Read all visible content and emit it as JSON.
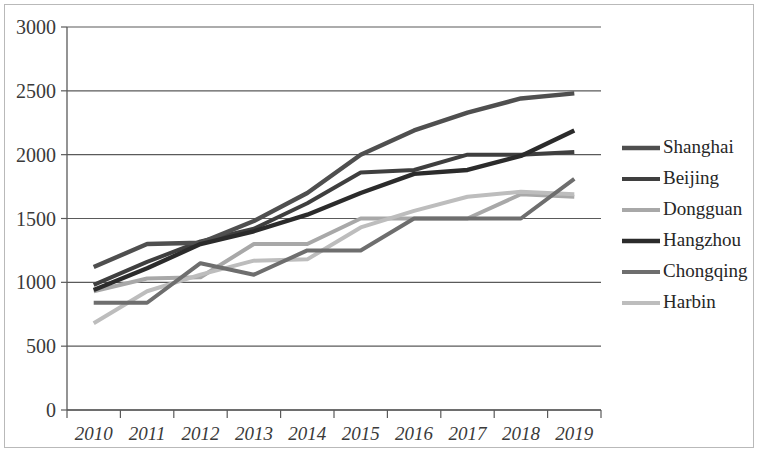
{
  "chart_data": {
    "type": "line",
    "title": "",
    "subtitle": "",
    "xlabel": "",
    "ylabel": "",
    "x": [
      "2010",
      "2011",
      "2012",
      "2013",
      "2014",
      "2015",
      "2016",
      "2017",
      "2018",
      "2019"
    ],
    "categories": [
      "2010",
      "2011",
      "2012",
      "2013",
      "2014",
      "2015",
      "2016",
      "2017",
      "2018",
      "2019"
    ],
    "xtick_labels": [
      "2010",
      "2011",
      "2012",
      "2013",
      "2014",
      "2015",
      "2016",
      "2017",
      "2018",
      "2019"
    ],
    "ytick_labels": [
      "0",
      "500",
      "1000",
      "1500",
      "2000",
      "2500",
      "3000"
    ],
    "ytick_values": [
      0,
      500,
      1000,
      1500,
      2000,
      2500,
      3000
    ],
    "ylim": [
      0,
      3000
    ],
    "grid": "horizontal",
    "legend_position": "right",
    "series": [
      {
        "name": "Shanghai",
        "color": "#4f4f4f",
        "width": 4.4,
        "values": [
          1120,
          1300,
          1310,
          1480,
          1700,
          2000,
          2190,
          2330,
          2440,
          2480
        ]
      },
      {
        "name": "Beijing",
        "color": "#3f3f3f",
        "width": 4.0,
        "values": [
          980,
          1160,
          1320,
          1420,
          1620,
          1860,
          1880,
          2000,
          2000,
          2020
        ]
      },
      {
        "name": "Dongguan",
        "color": "#a8a8a8",
        "width": 4.0,
        "values": [
          930,
          1030,
          1040,
          1300,
          1300,
          1500,
          1500,
          1500,
          1690,
          1670
        ]
      },
      {
        "name": "Hangzhou",
        "color": "#2b2b2b",
        "width": 4.4,
        "values": [
          940,
          1110,
          1300,
          1400,
          1530,
          1700,
          1850,
          1880,
          1990,
          2190
        ]
      },
      {
        "name": "Chongqing",
        "color": "#6e6e6e",
        "width": 4.0,
        "values": [
          840,
          840,
          1150,
          1060,
          1250,
          1250,
          1500,
          1500,
          1500,
          1810
        ]
      },
      {
        "name": "Harbin",
        "color": "#bdbdbd",
        "width": 4.0,
        "values": [
          680,
          930,
          1060,
          1170,
          1180,
          1430,
          1560,
          1670,
          1710,
          1690
        ]
      }
    ]
  },
  "legend": {
    "items": [
      {
        "label": "Shanghai"
      },
      {
        "label": "Beijing"
      },
      {
        "label": "Dongguan"
      },
      {
        "label": "Hangzhou"
      },
      {
        "label": "Chongqing"
      },
      {
        "label": "Harbin"
      }
    ]
  },
  "axes": {
    "y_min_label": "0",
    "y_max_label": "3000"
  }
}
